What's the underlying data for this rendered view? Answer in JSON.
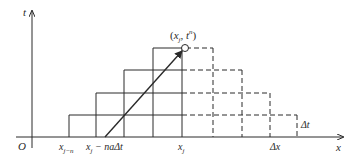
{
  "diagram": {
    "type": "characteristic-grid",
    "colors": {
      "line": "#2a2a2a",
      "background": "#ffffff"
    },
    "axes": {
      "x_label": "x",
      "t_label": "t",
      "origin_label": "O"
    },
    "point": {
      "label": "(xⱼ, tⁿ)",
      "label_parts": [
        "(",
        "x",
        "j",
        ", ",
        "t",
        "n",
        ")"
      ]
    },
    "labels": {
      "x_j_minus_n": {
        "base": "x",
        "sub": "j−n"
      },
      "x_j_minus_nadt": {
        "text": "xⱼ − naΔt",
        "base": "x",
        "sub": "j",
        "rest": " − naΔt"
      },
      "x_j": {
        "base": "x",
        "sub": "j"
      },
      "delta_x": "Δx",
      "delta_t": "Δt"
    },
    "grid": {
      "solid_rows": 4,
      "dashed_rows": 4,
      "solid_region": "staircase left of x_j",
      "dashed_region": "staircase right of x_j"
    },
    "arrow": {
      "from": "x_j - naΔt on x-axis",
      "to": "(x_j, t^n)"
    }
  }
}
